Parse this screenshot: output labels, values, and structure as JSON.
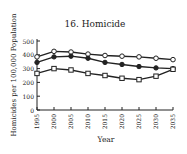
{
  "chart_data": {
    "type": "line",
    "title": "16. Homicide",
    "xlabel": "Year",
    "ylabel": "Homicides per 100,000 Population",
    "x": [
      1995,
      2000,
      2005,
      2010,
      2015,
      2020,
      2025,
      2030,
      2035
    ],
    "x_tick_labels": [
      "1995",
      "2000",
      "2005",
      "2010",
      "2015",
      "2020",
      "2025",
      "2030",
      "2035"
    ],
    "y_ticks": [
      0,
      100,
      200,
      300,
      400,
      500
    ],
    "ylim": [
      0,
      500
    ],
    "grid": false,
    "legend": null,
    "series": [
      {
        "name": "upper",
        "marker": "open-circle",
        "values": [
          385,
          425,
          420,
          405,
          395,
          390,
          385,
          375,
          365
        ]
      },
      {
        "name": "middle",
        "marker": "filled-circle",
        "values": [
          345,
          385,
          390,
          375,
          345,
          330,
          315,
          305,
          300
        ]
      },
      {
        "name": "lower",
        "marker": "open-square",
        "values": [
          265,
          300,
          290,
          265,
          250,
          230,
          220,
          245,
          295
        ]
      }
    ]
  }
}
